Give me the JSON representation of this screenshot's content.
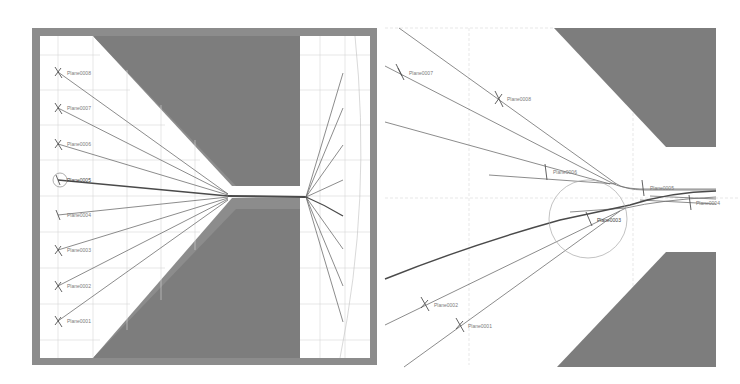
{
  "figure": {
    "colors": {
      "background": "#ffffff",
      "frame": "#8c8c8c",
      "obstacle": "#7d7d7d",
      "grid": "#d6d6d6",
      "streamline": "#6e6e6e",
      "streamline_bold": "#4a4a4a",
      "label": "#7a7a7a",
      "circle": "#a0a0a0"
    }
  },
  "left_panel": {
    "name": "overview",
    "plane_labels": [
      {
        "text": "Plane0008",
        "x": 59,
        "y": 73
      },
      {
        "text": "Plane0007",
        "x": 59,
        "y": 108
      },
      {
        "text": "Plane0006",
        "x": 59,
        "y": 144
      },
      {
        "text": "Plane0005",
        "x": 59,
        "y": 180
      },
      {
        "text": "Plane0004",
        "x": 59,
        "y": 215
      },
      {
        "text": "Plane0003",
        "x": 59,
        "y": 250
      },
      {
        "text": "Plane0002",
        "x": 59,
        "y": 286
      },
      {
        "text": "Plane0001",
        "x": 59,
        "y": 321
      }
    ],
    "selected_plane": "Plane0005"
  },
  "right_panel": {
    "name": "zoomed-detail",
    "plane_labels": [
      {
        "text": "Plane0007",
        "x": 401,
        "y": 73
      },
      {
        "text": "Plane0008",
        "x": 499,
        "y": 99
      },
      {
        "text": "Plane0006",
        "x": 544,
        "y": 172
      },
      {
        "text": "Plane0005",
        "x": 643,
        "y": 187
      },
      {
        "text": "Plane0004",
        "x": 690,
        "y": 202
      },
      {
        "text": "Plane0003",
        "x": 590,
        "y": 219
      },
      {
        "text": "Plane0002",
        "x": 426,
        "y": 304
      },
      {
        "text": "Plane0001",
        "x": 460,
        "y": 325
      }
    ]
  }
}
